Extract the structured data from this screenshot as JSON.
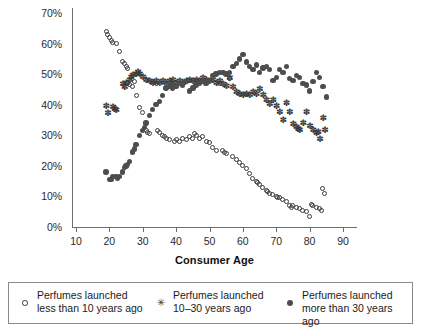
{
  "chart_data": {
    "type": "scatter",
    "title": "",
    "xlabel": "Consumer Age",
    "ylabel": "",
    "xlim": [
      5,
      95
    ],
    "ylim": [
      0,
      70
    ],
    "xticks": [
      10,
      20,
      30,
      40,
      50,
      60,
      70,
      80,
      90
    ],
    "xtick_labels": [
      "10",
      "20",
      "30",
      "40",
      "50",
      "60",
      "70",
      "80",
      "90"
    ],
    "yticks": [
      0,
      10,
      20,
      30,
      40,
      50,
      60,
      70
    ],
    "ytick_labels": [
      "0%",
      "10%",
      "20%",
      "30%",
      "40%",
      "50%",
      "60%",
      "70%"
    ],
    "grid": false,
    "legend_position": "below",
    "marker_colors": {
      "less_than_10": "#3a3a3a",
      "10_to_30": "#3a3a3a",
      "more_than_30": "#4d4d4d"
    },
    "series": [
      {
        "name": "Perfumes launched less than 10 years ago",
        "marker": "open-circle",
        "points": [
          [
            19,
            64.0
          ],
          [
            19.5,
            63.0
          ],
          [
            20,
            62.0
          ],
          [
            20.5,
            61.0
          ],
          [
            21,
            60.5
          ],
          [
            22,
            60.0
          ],
          [
            23,
            57.5
          ],
          [
            24,
            54.0
          ],
          [
            24.5,
            53.5
          ],
          [
            25,
            52.5
          ],
          [
            25.5,
            52.0
          ],
          [
            25.5,
            47.0
          ],
          [
            26,
            46.5
          ],
          [
            27,
            46.0
          ],
          [
            27.5,
            47.5
          ],
          [
            28,
            43.0
          ],
          [
            29,
            39.0
          ],
          [
            30,
            37.5
          ],
          [
            31,
            31.5
          ],
          [
            31.5,
            31.0
          ],
          [
            32,
            30.5
          ],
          [
            33,
            47.5
          ],
          [
            34,
            47.0
          ],
          [
            34.5,
            31.5
          ],
          [
            35,
            31.0
          ],
          [
            36,
            30.0
          ],
          [
            36.5,
            29.5
          ],
          [
            37,
            29.0
          ],
          [
            38,
            28.5
          ],
          [
            39,
            47.0
          ],
          [
            39.5,
            28.0
          ],
          [
            40,
            28.5
          ],
          [
            41,
            28.0
          ],
          [
            42,
            29.0
          ],
          [
            43,
            28.5
          ],
          [
            44,
            29.5
          ],
          [
            45,
            29.0
          ],
          [
            45.5,
            30.5
          ],
          [
            46,
            30.0
          ],
          [
            47,
            29.0
          ],
          [
            48,
            29.5
          ],
          [
            49,
            28.0
          ],
          [
            50,
            27.5
          ],
          [
            51,
            26.0
          ],
          [
            52,
            25.0
          ],
          [
            53,
            47.0
          ],
          [
            54,
            25.0
          ],
          [
            54.5,
            24.5
          ],
          [
            55,
            24.0
          ],
          [
            56,
            48.5
          ],
          [
            57,
            23.0
          ],
          [
            58,
            22.0
          ],
          [
            59,
            21.0
          ],
          [
            60,
            20.0
          ],
          [
            61,
            19.0
          ],
          [
            62,
            17.5
          ],
          [
            63,
            16.0
          ],
          [
            64,
            15.0
          ],
          [
            64.5,
            14.5
          ],
          [
            65,
            14.0
          ],
          [
            66,
            13.0
          ],
          [
            67,
            12.0
          ],
          [
            67.5,
            11.5
          ],
          [
            68,
            11.0
          ],
          [
            69,
            10.5
          ],
          [
            70,
            10.0
          ],
          [
            70.5,
            9.5
          ],
          [
            71,
            9.5
          ],
          [
            72,
            9.0
          ],
          [
            73,
            8.5
          ],
          [
            74,
            7.0
          ],
          [
            74.5,
            6.5
          ],
          [
            75,
            7.0
          ],
          [
            76,
            6.5
          ],
          [
            77,
            6.0
          ],
          [
            78,
            5.5
          ],
          [
            79,
            5.0
          ],
          [
            80,
            3.5
          ],
          [
            80.5,
            7.5
          ],
          [
            81,
            7.0
          ],
          [
            82,
            6.5
          ],
          [
            83,
            6.0
          ],
          [
            83.5,
            5.5
          ],
          [
            84,
            12.5
          ],
          [
            84.5,
            11.0
          ]
        ]
      },
      {
        "name": "Perfumes launched 10–30 years ago",
        "marker": "star",
        "points": [
          [
            19,
            39.5
          ],
          [
            19.5,
            37.0
          ],
          [
            21,
            39.0
          ],
          [
            21.5,
            38.5
          ],
          [
            22,
            38.0
          ],
          [
            24,
            46.5
          ],
          [
            24.5,
            45.5
          ],
          [
            25,
            47.0
          ],
          [
            26,
            48.0
          ],
          [
            26.5,
            49.0
          ],
          [
            27,
            49.5
          ],
          [
            28,
            50.0
          ],
          [
            28.5,
            50.5
          ],
          [
            29,
            50.0
          ],
          [
            30,
            49.0
          ],
          [
            31,
            48.0
          ],
          [
            32,
            47.5
          ],
          [
            33,
            47.0
          ],
          [
            34,
            47.5
          ],
          [
            35,
            47.0
          ],
          [
            36,
            47.5
          ],
          [
            37,
            47.0
          ],
          [
            38,
            47.5
          ],
          [
            39,
            48.0
          ],
          [
            40,
            47.0
          ],
          [
            41,
            47.5
          ],
          [
            42,
            47.0
          ],
          [
            43,
            47.5
          ],
          [
            44,
            48.0
          ],
          [
            45,
            47.5
          ],
          [
            46,
            48.0
          ],
          [
            47,
            47.5
          ],
          [
            48,
            48.5
          ],
          [
            49,
            48.0
          ],
          [
            50,
            47.5
          ],
          [
            51,
            48.0
          ],
          [
            52,
            47.0
          ],
          [
            53,
            47.5
          ],
          [
            54,
            46.5
          ],
          [
            55,
            46.0
          ],
          [
            56,
            48.5
          ],
          [
            57,
            45.5
          ],
          [
            58,
            44.0
          ],
          [
            59,
            43.5
          ],
          [
            60,
            43.0
          ],
          [
            61,
            43.5
          ],
          [
            62,
            43.0
          ],
          [
            63,
            44.0
          ],
          [
            64,
            43.5
          ],
          [
            65,
            45.0
          ],
          [
            66,
            43.0
          ],
          [
            67,
            41.5
          ],
          [
            68,
            40.0
          ],
          [
            69,
            41.5
          ],
          [
            70,
            39.5
          ],
          [
            71,
            37.5
          ],
          [
            72,
            35.0
          ],
          [
            73,
            40.5
          ],
          [
            74,
            37.5
          ],
          [
            75,
            33.5
          ],
          [
            76,
            32.5
          ],
          [
            76.5,
            32.0
          ],
          [
            77,
            31.5
          ],
          [
            78,
            34.0
          ],
          [
            79,
            37.5
          ],
          [
            80,
            33.0
          ],
          [
            81,
            31.5
          ],
          [
            82,
            30.5
          ],
          [
            82.5,
            31.0
          ],
          [
            83,
            28.5
          ],
          [
            84,
            35.5
          ],
          [
            84.5,
            31.5
          ]
        ]
      },
      {
        "name": "Perfumes launched more than 30 years ago",
        "marker": "filled-circle",
        "points": [
          [
            19,
            18.0
          ],
          [
            20,
            15.5
          ],
          [
            20.5,
            15.5
          ],
          [
            21,
            16.5
          ],
          [
            22,
            16.5
          ],
          [
            22.5,
            16.0
          ],
          [
            23,
            16.5
          ],
          [
            24,
            18.0
          ],
          [
            24.5,
            19.5
          ],
          [
            25,
            20.0
          ],
          [
            25.5,
            20.5
          ],
          [
            26,
            21.5
          ],
          [
            27,
            24.5
          ],
          [
            27.5,
            25.5
          ],
          [
            28,
            27.0
          ],
          [
            29,
            30.0
          ],
          [
            30,
            31.5
          ],
          [
            30.5,
            32.5
          ],
          [
            31,
            34.0
          ],
          [
            32,
            36.5
          ],
          [
            33,
            38.5
          ],
          [
            34,
            40.0
          ],
          [
            35,
            41.0
          ],
          [
            36,
            43.0
          ],
          [
            37,
            45.5
          ],
          [
            38,
            46.0
          ],
          [
            38.5,
            46.5
          ],
          [
            39,
            45.5
          ],
          [
            40,
            46.0
          ],
          [
            41,
            47.0
          ],
          [
            42,
            46.5
          ],
          [
            43,
            47.5
          ],
          [
            44,
            44.5
          ],
          [
            45,
            45.5
          ],
          [
            46,
            46.5
          ],
          [
            47,
            47.0
          ],
          [
            48,
            47.5
          ],
          [
            49,
            47.0
          ],
          [
            50,
            48.0
          ],
          [
            51,
            49.5
          ],
          [
            52,
            50.0
          ],
          [
            53,
            50.5
          ],
          [
            54,
            50.5
          ],
          [
            55,
            50.0
          ],
          [
            56,
            50.5
          ],
          [
            57,
            52.5
          ],
          [
            58,
            53.5
          ],
          [
            59,
            55.0
          ],
          [
            60,
            56.5
          ],
          [
            61,
            54.0
          ],
          [
            62,
            52.5
          ],
          [
            63,
            51.5
          ],
          [
            64,
            53.0
          ],
          [
            65,
            50.5
          ],
          [
            66,
            52.0
          ],
          [
            67,
            52.5
          ],
          [
            68,
            51.5
          ],
          [
            69,
            48.0
          ],
          [
            70,
            49.0
          ],
          [
            71,
            51.5
          ],
          [
            72,
            50.5
          ],
          [
            73,
            52.5
          ],
          [
            74,
            48.5
          ],
          [
            75,
            48.0
          ],
          [
            76,
            49.5
          ],
          [
            77,
            49.0
          ],
          [
            78,
            47.0
          ],
          [
            79,
            46.5
          ],
          [
            80,
            44.5
          ],
          [
            81,
            47.5
          ],
          [
            82,
            50.5
          ],
          [
            83,
            49.0
          ],
          [
            84,
            46.0
          ],
          [
            85,
            42.5
          ]
        ]
      }
    ]
  },
  "legend": {
    "entries": [
      {
        "marker": "open-circle",
        "label": "Perfumes launched\nless than 10 years ago"
      },
      {
        "marker": "star",
        "label": "Perfumes launched\n10–30 years ago"
      },
      {
        "marker": "filled-circle",
        "label": "Perfumes launched\nmore than 30 years ago"
      }
    ]
  }
}
